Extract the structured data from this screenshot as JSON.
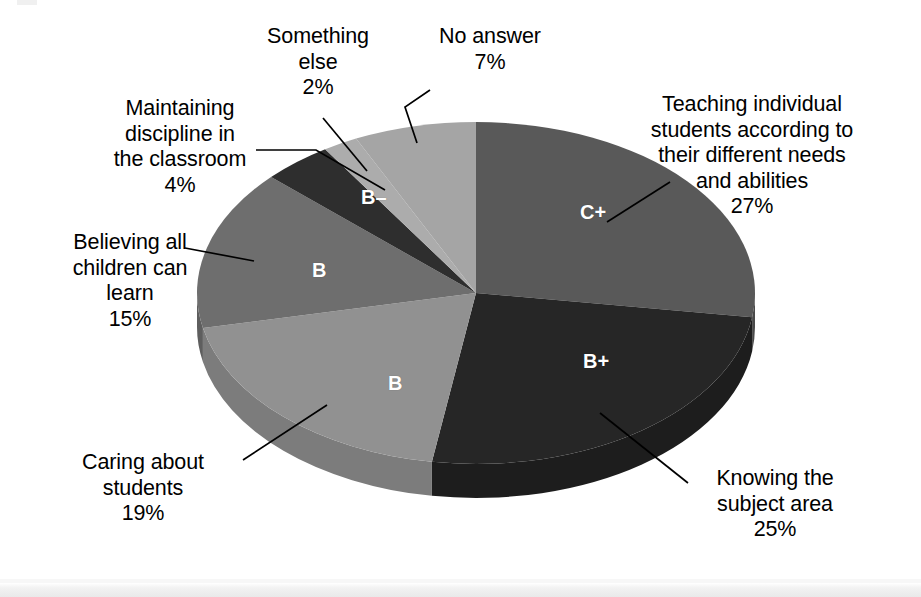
{
  "chart_data": {
    "type": "pie",
    "title": "",
    "subtitle": "",
    "legend_position": "callouts",
    "grid": false,
    "total_percent": 99,
    "start_angle_deg": 0,
    "direction": "clockwise",
    "categories": [
      "Teaching individual students according to their different needs and abilities",
      "Knowing the subject area",
      "Caring about students",
      "Believing all children can learn",
      "Maintaining discipline in the classroom",
      "Something else",
      "No answer"
    ],
    "values": [
      27,
      25,
      19,
      15,
      4,
      2,
      7
    ],
    "slice_inner_labels": [
      "C+",
      "B+",
      "B",
      "B",
      "B–",
      "",
      ""
    ],
    "colors": [
      "#595959",
      "#262626",
      "#919191",
      "#6e6e6e",
      "#2e2e2e",
      "#acacac",
      "#a5a5a5"
    ]
  },
  "slices": [
    {
      "id": "teaching",
      "label": "Teaching individual\nstudents according to\ntheir different needs\nand abilities\n27%",
      "name": "Teaching individual students according to their different needs and abilities",
      "percent_text": "27%",
      "value": 27,
      "inner_label": "C+",
      "color": "#595959",
      "side_color": "#4a4a4a"
    },
    {
      "id": "knowing",
      "label": "Knowing the\nsubject area\n25%",
      "name": "Knowing the subject area",
      "percent_text": "25%",
      "value": 25,
      "inner_label": "B+",
      "color": "#262626",
      "side_color": "#1d1d1d"
    },
    {
      "id": "caring",
      "label": "Caring about\nstudents\n19%",
      "name": "Caring about students",
      "percent_text": "19%",
      "value": 19,
      "inner_label": "B",
      "color": "#919191",
      "side_color": "#7c7c7c"
    },
    {
      "id": "believing",
      "label": "Believing all\nchildren can\nlearn\n15%",
      "name": "Believing all children can learn",
      "percent_text": "15%",
      "value": 15,
      "inner_label": "B",
      "color": "#6e6e6e",
      "side_color": "#5e5e5e"
    },
    {
      "id": "maintaining",
      "label": "Maintaining\ndiscipline in\nthe classroom\n4%",
      "name": "Maintaining discipline in the classroom",
      "percent_text": "4%",
      "value": 4,
      "inner_label": "B–",
      "color": "#2e2e2e",
      "side_color": "#242424"
    },
    {
      "id": "something",
      "label": "Something\nelse\n2%",
      "name": "Something else",
      "percent_text": "2%",
      "value": 2,
      "inner_label": "",
      "color": "#acacac",
      "side_color": "#939393"
    },
    {
      "id": "noanswer",
      "label": "No answer\n7%",
      "name": "No answer",
      "percent_text": "7%",
      "value": 7,
      "inner_label": "",
      "color": "#a5a5a5",
      "side_color": "#8d8d8d"
    }
  ],
  "inner_labels": {
    "cplus": "C+",
    "bplus": "B+",
    "b_light": "B",
    "b_medium": "B",
    "bminus": "B–"
  }
}
